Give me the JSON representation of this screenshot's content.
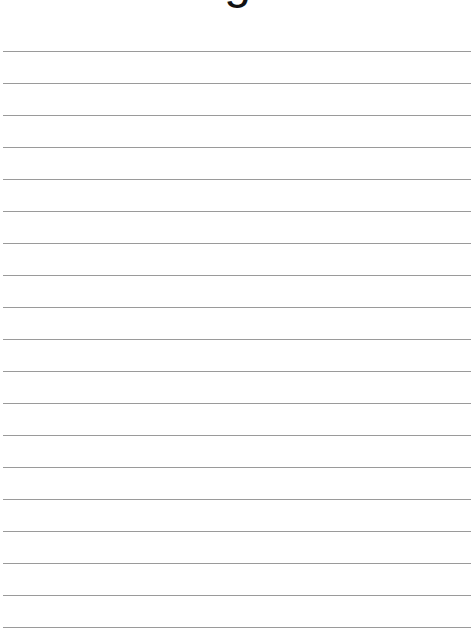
{
  "page": {
    "title_fragment": "g",
    "line_count": 19,
    "line_start_y": 51,
    "line_spacing": 32,
    "line_color": "#9a9a9a"
  }
}
